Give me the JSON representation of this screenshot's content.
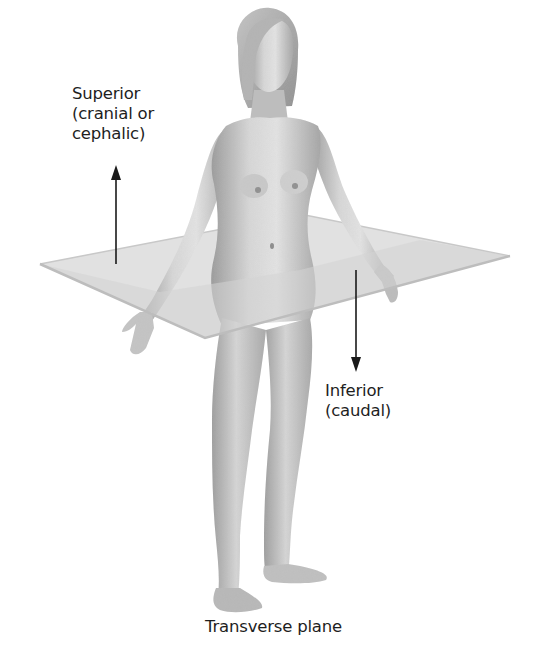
{
  "diagram": {
    "title": "Transverse plane",
    "plane": {
      "name": "Transverse plane",
      "fill_color": "#d9d9d9",
      "edge_color": "#bdbdbd",
      "corners": {
        "left": [
          40,
          264
        ],
        "back": [
          300,
          214
        ],
        "right": [
          510,
          256
        ],
        "front": [
          205,
          338
        ]
      }
    },
    "directions": [
      {
        "id": "superior",
        "lines": [
          "Superior",
          "(cranial or",
          "cephalic)"
        ],
        "arrow": "up",
        "color": "#1a1a1a"
      },
      {
        "id": "inferior",
        "lines": [
          "Inferior",
          "(caudal)"
        ],
        "arrow": "down",
        "color": "#1a1a1a"
      }
    ],
    "colors": {
      "background": "#ffffff",
      "text": "#1e1e1e",
      "skin_light": "#e2e2e2",
      "skin_mid": "#b9b9b9",
      "skin_dark": "#8a8a8a"
    }
  }
}
